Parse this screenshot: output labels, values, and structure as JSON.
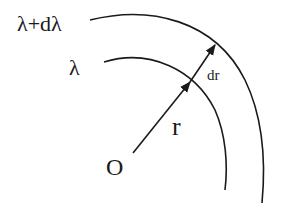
{
  "diagram": {
    "labels": {
      "outer": "λ+dλ",
      "inner": "λ",
      "radius": "r",
      "increment": "dr",
      "origin": "O"
    },
    "colors": {
      "stroke": "#1a1a1a",
      "background": "#ffffff"
    }
  }
}
